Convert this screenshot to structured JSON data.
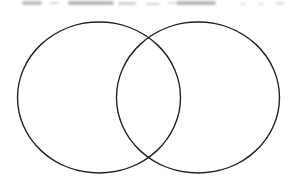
{
  "diagram": {
    "type": "venn",
    "set_count": 2,
    "stroke_color": "#222222",
    "fill_color": "#ffffff",
    "background_color": "#ffffff",
    "circles": [
      {
        "name": "left-set",
        "cx": 99,
        "cy": 97.5,
        "rx": 81.5,
        "ry": 75.5,
        "label": ""
      },
      {
        "name": "right-set",
        "cx": 198,
        "cy": 97.5,
        "rx": 81.5,
        "ry": 75.5,
        "label": ""
      }
    ],
    "intersection_label": ""
  },
  "top_strip": {
    "description": "illegible cut-off text remnants",
    "color": "#8a8a8a",
    "smudges": [
      {
        "x": 22,
        "y": 1,
        "w": 20,
        "h": 4,
        "o": 0.55
      },
      {
        "x": 50,
        "y": 2,
        "w": 8,
        "h": 2,
        "o": 0.35
      },
      {
        "x": 68,
        "y": 1,
        "w": 46,
        "h": 4,
        "o": 0.6
      },
      {
        "x": 118,
        "y": 2,
        "w": 18,
        "h": 3,
        "o": 0.4
      },
      {
        "x": 146,
        "y": 3,
        "w": 14,
        "h": 2,
        "o": 0.35
      },
      {
        "x": 168,
        "y": 2,
        "w": 8,
        "h": 2,
        "o": 0.3
      },
      {
        "x": 176,
        "y": 1,
        "w": 40,
        "h": 4,
        "o": 0.6
      },
      {
        "x": 240,
        "y": 3,
        "w": 6,
        "h": 2,
        "o": 0.25
      },
      {
        "x": 258,
        "y": 3,
        "w": 6,
        "h": 2,
        "o": 0.25
      },
      {
        "x": 276,
        "y": 2,
        "w": 8,
        "h": 3,
        "o": 0.3
      }
    ]
  }
}
